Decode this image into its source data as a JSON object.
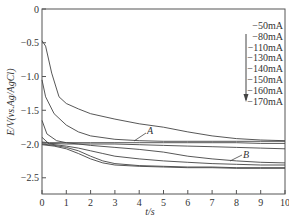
{
  "chart_data": {
    "type": "line",
    "title": "",
    "xlabel": "t/s",
    "ylabel": "E/V(vs.Ag/AgCl)",
    "xlim": [
      0,
      10
    ],
    "ylim": [
      -2.74,
      0
    ],
    "xticks": [
      "0",
      "1",
      "2",
      "3",
      "4",
      "5",
      "6",
      "7",
      "8",
      "9",
      "10"
    ],
    "yticks": [
      "0",
      "-0.5",
      "-1.0",
      "-1.5",
      "-2.0",
      "-2.5"
    ],
    "grid": false,
    "legend_position": "upper right",
    "legend_arrow": "down",
    "legend": [
      "-50mA",
      "-80mA",
      "-110mA",
      "-130mA",
      "-140mA",
      "-150mA",
      "-160mA",
      "-170mA"
    ],
    "annotations": [
      {
        "text": "A",
        "x": 4.4,
        "y": -1.87
      },
      {
        "text": "B",
        "x": 7.8,
        "y": -2.1
      }
    ],
    "series": [
      {
        "name": "curve-top",
        "x": [
          0,
          0.15,
          0.4,
          0.7,
          1,
          1.5,
          2,
          3,
          4,
          5,
          6,
          7,
          8,
          9,
          10
        ],
        "y": [
          -0.47,
          -0.55,
          -0.95,
          -1.3,
          -1.4,
          -1.48,
          -1.55,
          -1.63,
          -1.7,
          -1.75,
          -1.82,
          -1.88,
          -1.92,
          -1.94,
          -1.95
        ]
      },
      {
        "name": "curve-2",
        "x": [
          0,
          0.15,
          0.5,
          1,
          1.5,
          2,
          3,
          4,
          5,
          6,
          7,
          8,
          9,
          10
        ],
        "y": [
          -1.05,
          -1.3,
          -1.55,
          -1.72,
          -1.82,
          -1.88,
          -1.93,
          -1.95,
          -1.96,
          -1.96,
          -1.96,
          -1.96,
          -1.96,
          -1.96
        ]
      },
      {
        "name": "curve-A",
        "x": [
          0,
          0.3,
          1,
          2,
          3,
          4,
          5,
          6,
          7,
          8,
          9,
          10
        ],
        "y": [
          -1.97,
          -1.98,
          -1.98,
          -1.98,
          -1.98,
          -1.98,
          -1.98,
          -1.98,
          -1.98,
          -1.98,
          -1.99,
          -1.99
        ]
      },
      {
        "name": "curve-4",
        "x": [
          0,
          0.3,
          1,
          2,
          3,
          4,
          5,
          6,
          7,
          8,
          9,
          10
        ],
        "y": [
          -1.98,
          -1.99,
          -2.0,
          -2.0,
          -2.0,
          -2.01,
          -2.02,
          -2.03,
          -2.04,
          -2.05,
          -2.06,
          -2.07
        ]
      },
      {
        "name": "curve-5",
        "x": [
          0,
          0.2,
          0.6,
          1,
          1.5,
          2,
          3,
          4,
          5,
          6,
          7,
          8,
          9,
          10
        ],
        "y": [
          -1.65,
          -1.85,
          -1.95,
          -1.98,
          -2.0,
          -2.02,
          -2.05,
          -2.08,
          -2.12,
          -2.18,
          -2.22,
          -2.25,
          -2.27,
          -2.28
        ]
      },
      {
        "name": "curve-B",
        "x": [
          0,
          0.3,
          1,
          1.5,
          2,
          2.5,
          3,
          4,
          5,
          6,
          7,
          8,
          9,
          10
        ],
        "y": [
          -1.9,
          -2.0,
          -2.03,
          -2.06,
          -2.1,
          -2.14,
          -2.18,
          -2.22,
          -2.25,
          -2.27,
          -2.29,
          -2.3,
          -2.31,
          -2.31
        ]
      },
      {
        "name": "curve-7",
        "x": [
          0,
          0.5,
          1,
          1.5,
          2,
          2.5,
          3,
          4,
          5,
          6,
          7,
          8,
          9,
          10
        ],
        "y": [
          -2.0,
          -2.02,
          -2.05,
          -2.1,
          -2.18,
          -2.25,
          -2.29,
          -2.32,
          -2.33,
          -2.34,
          -2.34,
          -2.35,
          -2.35,
          -2.35
        ]
      },
      {
        "name": "curve-8",
        "x": [
          0,
          0.5,
          1,
          1.5,
          2,
          2.5,
          3,
          4,
          5,
          6,
          7,
          8,
          9,
          10
        ],
        "y": [
          -2.01,
          -2.03,
          -2.07,
          -2.14,
          -2.22,
          -2.28,
          -2.31,
          -2.33,
          -2.34,
          -2.35,
          -2.35,
          -2.36,
          -2.36,
          -2.36
        ]
      }
    ]
  }
}
